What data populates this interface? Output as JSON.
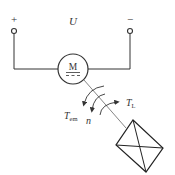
{
  "diagram": {
    "supply": {
      "positive_label": "+",
      "negative_label": "−",
      "voltage_label": "U"
    },
    "motor": {
      "label": "M",
      "symbol_note": "DC (line over dashes)"
    },
    "torques": {
      "electromagnetic_torque_label": "T",
      "electromagnetic_torque_sub": "em",
      "speed_label": "n",
      "load_torque_label": "T",
      "load_torque_sub": "L"
    },
    "load": {
      "description": "mechanical load box"
    },
    "colors": {
      "line": "#333333",
      "text": "#333333",
      "shaft": "#777777",
      "background": "#ffffff"
    }
  }
}
